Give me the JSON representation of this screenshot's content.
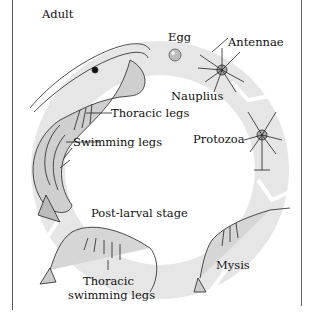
{
  "colors": {
    "ring": "#e8e8e8",
    "ink": "#1a1a1a",
    "shrimp_body": "#d4d4d4",
    "border": "#555555"
  },
  "stages": [
    {
      "id": "egg",
      "label": "Egg"
    },
    {
      "id": "nauplius",
      "label": "Nauplius"
    },
    {
      "id": "protozoa",
      "label": "Protozoa"
    },
    {
      "id": "mysis",
      "label": "Mysis"
    },
    {
      "id": "post-larval",
      "label": "Post-larval stage"
    },
    {
      "id": "adult",
      "label": "Adult"
    }
  ],
  "annotations": {
    "antennae": "Antennae",
    "thoracic_legs": "Thoracic legs",
    "swimming_legs": "Swimming legs",
    "thoracic_swimming_legs_1": "Thoracic",
    "thoracic_swimming_legs_2": "swimming legs"
  }
}
